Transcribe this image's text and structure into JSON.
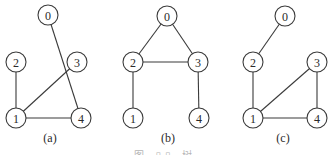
{
  "figure": {
    "node_radius": 10,
    "graphs": [
      {
        "label": "(a)",
        "label_pos": [
          50,
          142
        ],
        "nodes": [
          {
            "id": "0",
            "x": 48,
            "y": 15
          },
          {
            "id": "2",
            "x": 16,
            "y": 62
          },
          {
            "id": "3",
            "x": 77,
            "y": 62
          },
          {
            "id": "1",
            "x": 16,
            "y": 118
          },
          {
            "id": "4",
            "x": 81,
            "y": 118
          }
        ],
        "edges": [
          [
            "0",
            "4"
          ],
          [
            "2",
            "1"
          ],
          [
            "3",
            "1"
          ],
          [
            "1",
            "4"
          ]
        ]
      },
      {
        "label": "(b)",
        "label_pos": [
          168,
          142
        ],
        "nodes": [
          {
            "id": "0",
            "x": 167,
            "y": 16
          },
          {
            "id": "2",
            "x": 133,
            "y": 62
          },
          {
            "id": "3",
            "x": 198,
            "y": 62
          },
          {
            "id": "1",
            "x": 133,
            "y": 118
          },
          {
            "id": "4",
            "x": 199,
            "y": 118
          }
        ],
        "edges": [
          [
            "0",
            "2"
          ],
          [
            "0",
            "3"
          ],
          [
            "2",
            "3"
          ],
          [
            "2",
            "1"
          ],
          [
            "3",
            "4"
          ]
        ]
      },
      {
        "label": "(c)",
        "label_pos": [
          283,
          142
        ],
        "nodes": [
          {
            "id": "0",
            "x": 285,
            "y": 16
          },
          {
            "id": "2",
            "x": 253,
            "y": 62
          },
          {
            "id": "3",
            "x": 317,
            "y": 62
          },
          {
            "id": "1",
            "x": 253,
            "y": 118
          },
          {
            "id": "4",
            "x": 317,
            "y": 118
          }
        ],
        "edges": [
          [
            "0",
            "2"
          ],
          [
            "2",
            "1"
          ],
          [
            "3",
            "1"
          ],
          [
            "3",
            "4"
          ],
          [
            "1",
            "4"
          ]
        ]
      }
    ],
    "caption": "图 ▯▯ 树"
  }
}
